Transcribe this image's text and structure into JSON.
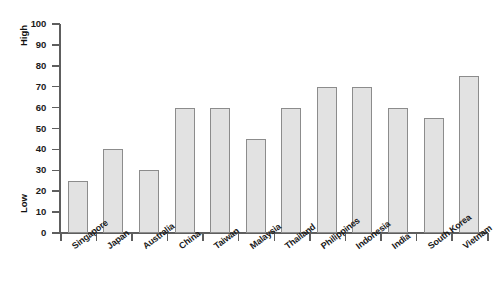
{
  "chart_data": {
    "type": "bar",
    "title": "",
    "subtitle": "",
    "xlabel": "",
    "ylabel": "",
    "categories": [
      "Singapore",
      "Japan",
      "Australia",
      "China",
      "Taiwan",
      "Malaysia",
      "Thailand",
      "Philippines",
      "Indonesia",
      "India",
      "South Korea",
      "Vietnam"
    ],
    "values": [
      25,
      40,
      30,
      60,
      60,
      45,
      60,
      70,
      70,
      60,
      55,
      75
    ],
    "ylim": [
      0,
      100
    ],
    "yticks": [
      0,
      10,
      20,
      30,
      40,
      50,
      60,
      70,
      80,
      90,
      100
    ],
    "ytick_labels": [
      "0",
      "10",
      "20",
      "30",
      "40",
      "50",
      "60",
      "70",
      "80",
      "90",
      "100"
    ],
    "annotations": {
      "y_axis_high": "High",
      "y_axis_low": "Low"
    },
    "grid": false,
    "legend": null,
    "legend_position": "none",
    "colors": {
      "bar_fill": "#e2e2e2",
      "bar_edge": "#8c8c8c",
      "axis": "#5e5e5e",
      "text": "#1a1a1a",
      "background": "#ffffff"
    }
  }
}
